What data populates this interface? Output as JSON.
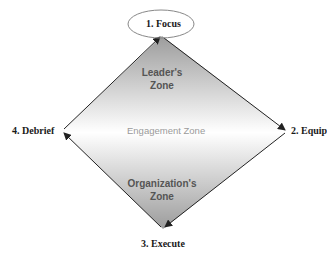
{
  "diagram": {
    "nodes": [
      {
        "id": "focus",
        "label": "1. Focus"
      },
      {
        "id": "equip",
        "label": "2. Equip"
      },
      {
        "id": "execute",
        "label": "3. Execute"
      },
      {
        "id": "debrief",
        "label": "4. Debrief"
      }
    ],
    "zones": {
      "top_line1": "Leader's",
      "top_line2": "Zone",
      "middle": "Engagement Zone",
      "bottom_line1": "Organization's",
      "bottom_line2": "Zone"
    },
    "edges": [
      {
        "from": "focus",
        "to": "equip"
      },
      {
        "from": "equip",
        "to": "execute"
      },
      {
        "from": "execute",
        "to": "debrief"
      },
      {
        "from": "debrief",
        "to": "focus"
      }
    ],
    "colors": {
      "shade": "#a8a8a8",
      "edge": "#222222"
    }
  }
}
